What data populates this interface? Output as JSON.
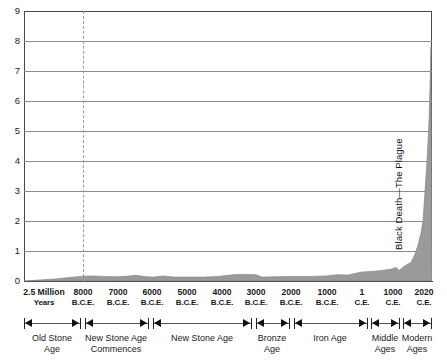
{
  "chart_data": {
    "type": "area",
    "title": "",
    "xlabel": "",
    "ylabel": "",
    "ylim": [
      0,
      9
    ],
    "yticks": [
      "0",
      "1",
      "2",
      "3",
      "4",
      "5",
      "6",
      "7",
      "8",
      "9"
    ],
    "grid": true,
    "legend": null,
    "units": "billions of people",
    "series_name": "World population",
    "fill_color": "#9a9a9a",
    "x_domain": [
      -10000,
      2020
    ],
    "xticks": [
      {
        "label": "2.5 Million",
        "sublabel": "Years",
        "x_px": 44
      },
      {
        "label": "8000",
        "sublabel": "B.C.E.",
        "x_px": 83
      },
      {
        "label": "7000",
        "sublabel": "B.C.E.",
        "x_px": 118
      },
      {
        "label": "6000",
        "sublabel": "B.C.E.",
        "x_px": 152
      },
      {
        "label": "5000",
        "sublabel": "B.C.E.",
        "x_px": 187
      },
      {
        "label": "4000",
        "sublabel": "B.C.E.",
        "x_px": 222
      },
      {
        "label": "3000",
        "sublabel": "B.C.E.",
        "x_px": 256
      },
      {
        "label": "2000",
        "sublabel": "B.C.E.",
        "x_px": 291
      },
      {
        "label": "1000",
        "sublabel": "B.C.E.",
        "x_px": 327
      },
      {
        "label": "1",
        "sublabel": "C.E.",
        "x_px": 362
      },
      {
        "label": "1000",
        "sublabel": "C.E.",
        "x_px": 393
      },
      {
        "label": "2020",
        "sublabel": "C.E.",
        "x_px": 424
      }
    ],
    "points": [
      {
        "year": "2.5 Million Years",
        "x_px": 24,
        "value": 0.0
      },
      {
        "year": "50000 B.C.E.",
        "x_px": 38,
        "value": 0.03
      },
      {
        "year": "20000 B.C.E.",
        "x_px": 55,
        "value": 0.07
      },
      {
        "year": "10000 B.C.E.",
        "x_px": 70,
        "value": 0.12
      },
      {
        "year": "8000 B.C.E.",
        "x_px": 83,
        "value": 0.16
      },
      {
        "year": "7600 B.C.E.",
        "x_px": 92,
        "value": 0.17
      },
      {
        "year": "7200 B.C.E.",
        "x_px": 104,
        "value": 0.15
      },
      {
        "year": "6800 B.C.E.",
        "x_px": 116,
        "value": 0.14
      },
      {
        "year": "6400 B.C.E.",
        "x_px": 127,
        "value": 0.16
      },
      {
        "year": "6100 B.C.E.",
        "x_px": 136,
        "value": 0.19
      },
      {
        "year": "5900 B.C.E.",
        "x_px": 146,
        "value": 0.14
      },
      {
        "year": "5600 B.C.E.",
        "x_px": 154,
        "value": 0.13
      },
      {
        "year": "5300 B.C.E.",
        "x_px": 163,
        "value": 0.17
      },
      {
        "year": "5000 B.C.E.",
        "x_px": 174,
        "value": 0.13
      },
      {
        "year": "4600 B.C.E.",
        "x_px": 188,
        "value": 0.13
      },
      {
        "year": "4200 B.C.E.",
        "x_px": 203,
        "value": 0.13
      },
      {
        "year": "3800 B.C.E.",
        "x_px": 218,
        "value": 0.15
      },
      {
        "year": "3500 B.C.E.",
        "x_px": 228,
        "value": 0.19
      },
      {
        "year": "3300 B.C.E.",
        "x_px": 236,
        "value": 0.22
      },
      {
        "year": "3000 B.C.E.",
        "x_px": 247,
        "value": 0.22
      },
      {
        "year": "2700 B.C.E.",
        "x_px": 256,
        "value": 0.21
      },
      {
        "year": "2500 B.C.E.",
        "x_px": 262,
        "value": 0.13
      },
      {
        "year": "2200 B.C.E.",
        "x_px": 275,
        "value": 0.14
      },
      {
        "year": "1800 B.C.E.",
        "x_px": 292,
        "value": 0.15
      },
      {
        "year": "1400 B.C.E.",
        "x_px": 309,
        "value": 0.15
      },
      {
        "year": "1000 B.C.E.",
        "x_px": 326,
        "value": 0.17
      },
      {
        "year": "700 B.C.E.",
        "x_px": 337,
        "value": 0.21
      },
      {
        "year": "400 B.C.E.",
        "x_px": 348,
        "value": 0.2
      },
      {
        "year": "1 C.E.",
        "x_px": 362,
        "value": 0.3
      },
      {
        "year": "400 C.E.",
        "x_px": 371,
        "value": 0.32
      },
      {
        "year": "800 C.E.",
        "x_px": 382,
        "value": 0.35
      },
      {
        "year": "1200 C.E.",
        "x_px": 392,
        "value": 0.4
      },
      {
        "year": "1340 C.E.",
        "x_px": 396,
        "value": 0.46
      },
      {
        "year": "1400 C.E.",
        "x_px": 399,
        "value": 0.35
      },
      {
        "year": "1500 C.E.",
        "x_px": 403,
        "value": 0.46
      },
      {
        "year": "1600 C.E.",
        "x_px": 407,
        "value": 0.55
      },
      {
        "year": "1700 C.E.",
        "x_px": 411,
        "value": 0.62
      },
      {
        "year": "1800 C.E.",
        "x_px": 415,
        "value": 0.9
      },
      {
        "year": "1850 C.E.",
        "x_px": 418,
        "value": 1.2
      },
      {
        "year": "1900 C.E.",
        "x_px": 421,
        "value": 1.6
      },
      {
        "year": "1930 C.E.",
        "x_px": 423,
        "value": 2.0
      },
      {
        "year": "1960 C.E.",
        "x_px": 425,
        "value": 3.0
      },
      {
        "year": "1975 C.E.",
        "x_px": 427,
        "value": 4.0
      },
      {
        "year": "1990 C.E.",
        "x_px": 429,
        "value": 5.3
      },
      {
        "year": "2005 C.E.",
        "x_px": 430,
        "value": 6.5
      },
      {
        "year": "2020 C.E.",
        "x_px": 431,
        "value": 7.8
      }
    ],
    "annotations": [
      {
        "id": "black-death",
        "text": "Black Death—The Plague",
        "orientation": "vertical",
        "x_px": 396,
        "y_top_px": 122,
        "y_bottom_px": 250
      },
      {
        "id": "agriculture-marker",
        "text": "",
        "style": "dashed-vertical",
        "x_px": 83
      }
    ]
  },
  "eras": [
    {
      "id": "old-stone-age",
      "name_line1": "Old Stone",
      "name_line2": "Age",
      "start_px": 24,
      "end_px": 80,
      "center_px": 52
    },
    {
      "id": "new-stone-age-commences",
      "name_line1": "New Stone Age",
      "name_line2": "Commences",
      "start_px": 85,
      "end_px": 148,
      "center_px": 116
    },
    {
      "id": "new-stone-age",
      "name_line1": "New Stone Age",
      "name_line2": "",
      "start_px": 153,
      "end_px": 251,
      "center_px": 202
    },
    {
      "id": "bronze-age",
      "name_line1": "Bronze",
      "name_line2": "Age",
      "start_px": 256,
      "end_px": 289,
      "center_px": 272
    },
    {
      "id": "iron-age",
      "name_line1": "Iron Age",
      "name_line2": "",
      "start_px": 294,
      "end_px": 367,
      "center_px": 330
    },
    {
      "id": "middle-ages",
      "name_line1": "Middle",
      "name_line2": "Ages",
      "start_px": 371,
      "end_px": 399,
      "center_px": 385
    },
    {
      "id": "modern-ages",
      "name_line1": "Modern",
      "name_line2": "Ages",
      "start_px": 403,
      "end_px": 431,
      "center_px": 417
    }
  ],
  "style": {
    "fill_color": "#9a9a9a",
    "grid_color": "#8c8c8c",
    "axis_color": "#4a4a4a",
    "background": "#ffffff",
    "text_color": "#1a1a1a"
  }
}
